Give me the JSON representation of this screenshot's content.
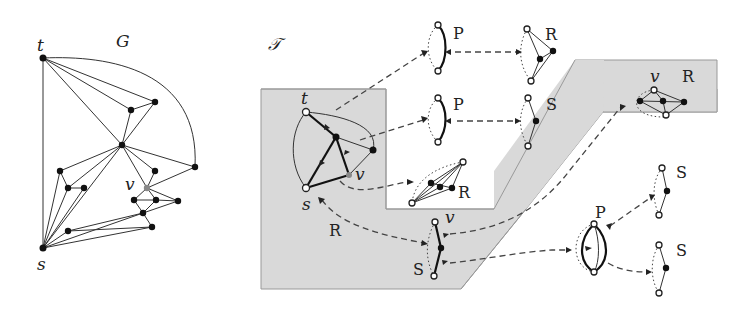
{
  "figure": {
    "graph_panel": {
      "title": "G",
      "vertex_labels": {
        "t": "t",
        "s": "s",
        "v": "v"
      }
    },
    "tree_panel": {
      "title": "𝒯",
      "root_skeleton": {
        "vertex_labels": {
          "t": "t",
          "s": "s",
          "v": "v"
        },
        "type_label": "R"
      },
      "nodes": [
        {
          "id": "p1",
          "type": "P"
        },
        {
          "id": "r1",
          "type": "R"
        },
        {
          "id": "p2",
          "type": "P"
        },
        {
          "id": "s1",
          "type": "S"
        },
        {
          "id": "r2",
          "type": "R",
          "vertex_label": "v"
        },
        {
          "id": "r3",
          "type": "R"
        },
        {
          "id": "s2",
          "type": "S",
          "vertex_label": "v"
        },
        {
          "id": "p3",
          "type": "P"
        },
        {
          "id": "s3",
          "type": "S"
        },
        {
          "id": "s4",
          "type": "S"
        }
      ]
    }
  }
}
